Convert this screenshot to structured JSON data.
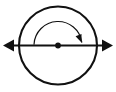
{
  "figure": {
    "title": "",
    "background_color": "#ffffff",
    "stroke_color": "#111111",
    "width": 116,
    "height": 92
  },
  "diagram_data": {
    "type": "geometric-diagram",
    "description": "Circle with a horizontal double-headed axis line through its center dot and a curved clockwise rotation arrow above the center",
    "elements": [
      {
        "name": "circle-outline",
        "shape": "circle",
        "center": [
          58,
          45.5
        ],
        "radius": 39,
        "stroke_width": 2.1,
        "fill": "none",
        "stroke": "#111111"
      },
      {
        "name": "horizontal-axis-line",
        "shape": "line",
        "from": [
          6,
          45.5
        ],
        "to": [
          110,
          45.5
        ],
        "stroke_width": 2.1,
        "stroke": "#111111",
        "arrowheads": "both"
      },
      {
        "name": "axis-arrowhead-left",
        "shape": "triangle",
        "tip": [
          3,
          45.5
        ],
        "direction": "left",
        "length": 11,
        "half_width": 6,
        "fill": "#111111"
      },
      {
        "name": "axis-arrowhead-right",
        "shape": "triangle",
        "tip": [
          113,
          45.5
        ],
        "direction": "right",
        "length": 11,
        "half_width": 6,
        "fill": "#111111"
      },
      {
        "name": "center-point-dot",
        "shape": "dot",
        "center": [
          58,
          45.5
        ],
        "radius": 2.9,
        "fill": "#111111"
      },
      {
        "name": "rotation-arc",
        "shape": "arc",
        "center": [
          58,
          45.5
        ],
        "radius": 24,
        "start_angle_deg": 183,
        "end_angle_deg": 352,
        "sweep": "clockwise",
        "stroke_width": 1.2,
        "fill": "none",
        "stroke": "#111111"
      },
      {
        "name": "rotation-arc-arrowhead",
        "shape": "triangle",
        "tip": [
          81.5,
          42.5
        ],
        "direction": "down-right",
        "angle_deg": 68,
        "length": 8,
        "half_width": 3.2,
        "fill": "#111111"
      }
    ],
    "labels": [],
    "annotations": []
  }
}
